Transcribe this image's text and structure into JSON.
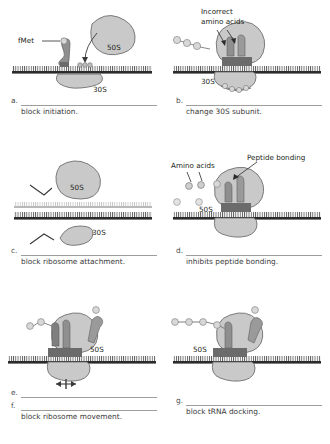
{
  "figure": {
    "colors": {
      "mrna_dark": "#2b2b2b",
      "mrna_ghost": "#b9b9b9",
      "subunit_fill": "#c9c9c9",
      "subunit_stroke": "#6f6f6f",
      "trna_fill": "#8f8f8f",
      "bead_fill": "#d8d8d8",
      "rule_color": "#9d9d9d",
      "text_color": "#231f20"
    }
  },
  "panels": [
    {
      "letter": "a.",
      "answer": "block initiation.",
      "blank_lines": 1,
      "labels": [
        {
          "name": "fmet-label",
          "text": "fMet"
        },
        {
          "name": "large-subunit-label",
          "text": "50S"
        },
        {
          "name": "small-subunit-label",
          "text": "30S"
        }
      ]
    },
    {
      "letter": "b.",
      "answer": "change 30S subunit.",
      "blank_lines": 1,
      "labels": [
        {
          "name": "incorrect-amino-acids-label-line1",
          "text": "Incorrect"
        },
        {
          "name": "incorrect-amino-acids-label-line2",
          "text": "amino acids"
        },
        {
          "name": "small-subunit-label",
          "text": "30S"
        }
      ]
    },
    {
      "letter": "c.",
      "answer": "block ribosome attachment.",
      "blank_lines": 1,
      "labels": [
        {
          "name": "large-subunit-label",
          "text": "50S"
        },
        {
          "name": "small-subunit-label",
          "text": "30S"
        }
      ]
    },
    {
      "letter": "d.",
      "answer": "inhibits peptide bonding.",
      "blank_lines": 1,
      "labels": [
        {
          "name": "amino-acids-label",
          "text": "Amino acids"
        },
        {
          "name": "peptide-bonding-label",
          "text": "Peptide bonding"
        },
        {
          "name": "large-subunit-label",
          "text": "50S"
        }
      ]
    },
    {
      "letter": "e.",
      "letter2": "f.",
      "answer": "block ribosome movement.",
      "blank_lines": 2,
      "labels": [
        {
          "name": "large-subunit-label",
          "text": "50S"
        }
      ]
    },
    {
      "letter": "g.",
      "answer": "block tRNA docking.",
      "blank_lines": 1,
      "labels": [
        {
          "name": "large-subunit-label",
          "text": "50S"
        }
      ]
    }
  ]
}
